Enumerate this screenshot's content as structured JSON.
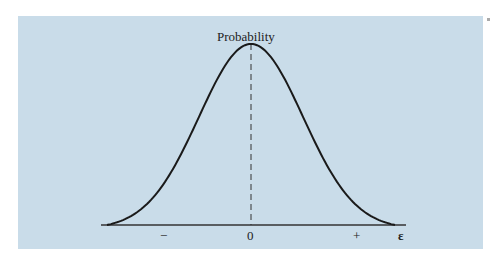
{
  "chart_data": {
    "type": "line",
    "title": "",
    "ylabel": "Probability",
    "xlabel": "ε",
    "x_tick_labels": [
      "−",
      "0",
      "+"
    ],
    "series": [
      {
        "name": "probability density",
        "shape": "gaussian",
        "mean": 0
      }
    ],
    "grid": false,
    "legend": null
  },
  "labels": {
    "y_axis": "Probability",
    "x_axis": "ε",
    "tick_minus": "−",
    "tick_zero": "0",
    "tick_plus": "+"
  },
  "colors": {
    "background": "#c9dce9",
    "curve": "#1a1a1a"
  }
}
